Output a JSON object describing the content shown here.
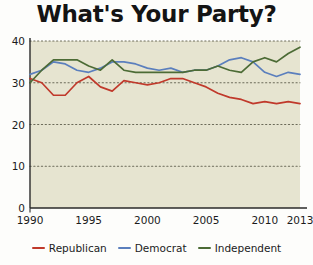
{
  "title": "What's Your Party?",
  "colors": {
    "plot_background": "#e6e4d0",
    "page_background": "#fdfdfb",
    "axis": "#2a2a2a",
    "grid": "#6b6a58",
    "republican": "#c0392b",
    "democrat": "#5b7fbd",
    "independent": "#4c6b35",
    "title_text": "#141414"
  },
  "legend": {
    "position": "bottom-center",
    "items": [
      {
        "label": "Republican",
        "color": "#c0392b",
        "icon": "line-swatch-icon"
      },
      {
        "label": "Democrat",
        "color": "#5b7fbd",
        "icon": "line-swatch-icon"
      },
      {
        "label": "Independent",
        "color": "#4c6b35",
        "icon": "line-swatch-icon"
      }
    ]
  },
  "axes": {
    "y_ticks": [
      "0",
      "10",
      "20",
      "30",
      "40"
    ],
    "y_tick_values": [
      0,
      10,
      20,
      30,
      40
    ],
    "x_ticks": [
      "1990",
      "1995",
      "2000",
      "2005",
      "2010",
      "2013"
    ],
    "x_tick_values": [
      1990,
      1995,
      2000,
      2005,
      2010,
      2013
    ],
    "x_minor_step": 1,
    "grid": "horizontal-dotted"
  },
  "chart_data": {
    "type": "line",
    "title": "What's Your Party?",
    "xlabel": "",
    "ylabel": "",
    "xlim": [
      1990,
      2013
    ],
    "ylim": [
      0,
      40
    ],
    "grid": true,
    "legend_position": "bottom-center",
    "x": [
      1990,
      1991,
      1992,
      1993,
      1994,
      1995,
      1996,
      1997,
      1998,
      1999,
      2000,
      2001,
      2002,
      2003,
      2004,
      2005,
      2006,
      2007,
      2008,
      2009,
      2010,
      2011,
      2012,
      2013
    ],
    "series": [
      {
        "name": "Republican",
        "color": "#c0392b",
        "values": [
          31,
          30,
          27,
          27,
          30,
          31.5,
          29,
          28,
          30.5,
          30,
          29.5,
          30,
          31,
          31,
          30,
          29,
          27.5,
          26.5,
          26,
          25,
          25.5,
          25,
          25.5,
          25
        ]
      },
      {
        "name": "Democrat",
        "color": "#5b7fbd",
        "values": [
          32,
          33,
          35,
          34.5,
          33,
          32.5,
          33.5,
          35,
          35,
          34.5,
          33.5,
          33,
          33.5,
          32.5,
          33,
          33,
          34,
          35.5,
          36,
          35,
          32.5,
          31.5,
          32.5,
          32
        ]
      },
      {
        "name": "Independent",
        "color": "#4c6b35",
        "values": [
          30,
          33,
          35.5,
          35.5,
          35.5,
          34,
          33,
          35.5,
          33,
          32.5,
          32.5,
          32.5,
          32.5,
          32.5,
          33,
          33,
          34,
          33,
          32.5,
          35,
          36,
          35,
          37,
          38.5
        ]
      }
    ]
  }
}
